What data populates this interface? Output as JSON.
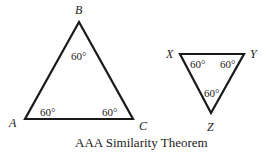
{
  "diagram": {
    "caption": "AAA Similarity Theorem",
    "triangle_abc": {
      "vertices": {
        "A": "A",
        "B": "B",
        "C": "C"
      },
      "angles": {
        "A": "60°",
        "B": "60°",
        "C": "60°"
      }
    },
    "triangle_xyz": {
      "vertices": {
        "X": "X",
        "Y": "Y",
        "Z": "Z"
      },
      "angles": {
        "X": "60°",
        "Y": "60°",
        "Z": "60°"
      }
    }
  }
}
